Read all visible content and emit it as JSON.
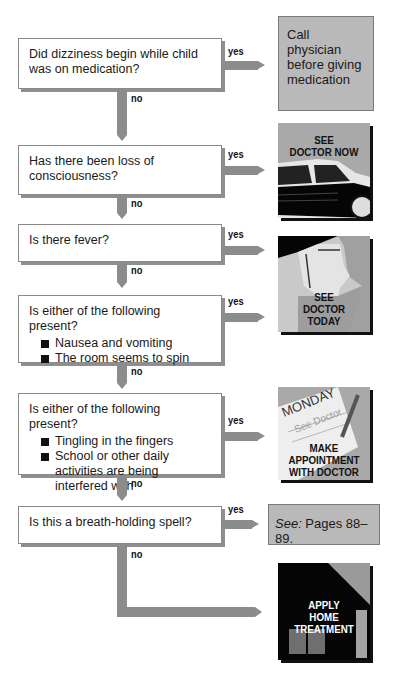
{
  "questions": [
    {
      "text": "Did dizziness begin while child was on medication?",
      "bullets": []
    },
    {
      "text": "Has there been loss of consciousness?",
      "bullets": []
    },
    {
      "text": "Is there fever?",
      "bullets": []
    },
    {
      "text": "Is either of the following present?",
      "bullets": [
        "Nausea and vomiting",
        "The room seems to spin"
      ]
    },
    {
      "text": "Is either of the following present?",
      "bullets": [
        "Tingling in the fingers",
        "School or other daily activities are being interfered with"
      ]
    },
    {
      "text": "Is this a breath-holding spell?",
      "bullets": []
    }
  ],
  "labels": {
    "yes": "yes",
    "no": "no"
  },
  "actions": [
    {
      "text": "Call physician before giving medication"
    },
    {
      "caption": [
        "SEE",
        "DOCTOR NOW"
      ],
      "icon": "car-icon"
    },
    {
      "caption": [
        "SEE",
        "DOCTOR",
        "TODAY"
      ],
      "icon": "face-profile-icon"
    },
    {
      "caption": [
        "MAKE",
        "APPOINTMENT",
        "WITH DOCTOR"
      ],
      "note_title": "MONDAY",
      "note_text": "See Doctor",
      "icon": "notepad-pencil-icon"
    },
    {
      "see_label": "See:",
      "text": " Pages 88–89."
    },
    {
      "caption": [
        "APPLY",
        "HOME",
        "TREATMENT"
      ],
      "icon": "house-icon"
    }
  ],
  "colors": {
    "arrow": "#8c8c8c",
    "action_bg": "#b9b9b9",
    "image_bg": "#a9a9a9"
  }
}
